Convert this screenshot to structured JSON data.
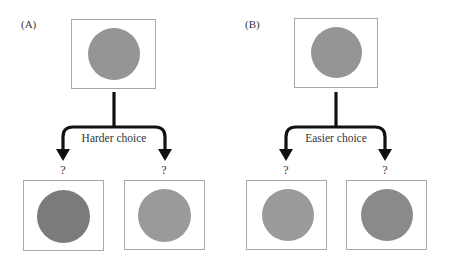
{
  "figure": {
    "panels": [
      {
        "id": "A",
        "label": "(A)",
        "choice_label": "Harder choice",
        "reference": {
          "color": "#959595"
        },
        "options": [
          {
            "question": "?",
            "color": "#7b7b7b"
          },
          {
            "question": "?",
            "color": "#9a9a9a"
          }
        ]
      },
      {
        "id": "B",
        "label": "(B)",
        "choice_label": "Easier choice",
        "reference": {
          "color": "#959595"
        },
        "options": [
          {
            "question": "?",
            "color": "#9a9a9a"
          },
          {
            "question": "?",
            "color": "#8a8a8a"
          }
        ]
      }
    ],
    "colors": {
      "arrow": "#111111",
      "box_border": "#a8a8a8",
      "background": "#ffffff"
    }
  }
}
